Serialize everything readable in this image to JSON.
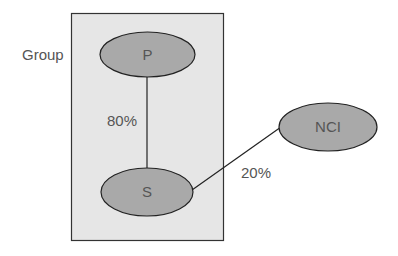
{
  "diagram": {
    "group": {
      "label": "Group",
      "fill": "#e6e6e6",
      "stroke": "#333333"
    },
    "nodes": [
      {
        "id": "P",
        "label": "P",
        "fill": "#a9a9a9"
      },
      {
        "id": "S",
        "label": "S",
        "fill": "#a9a9a9"
      },
      {
        "id": "NCI",
        "label": "NCI",
        "fill": "#a9a9a9"
      }
    ],
    "edges": [
      {
        "from": "P",
        "to": "S",
        "label": "80%"
      },
      {
        "from": "S",
        "to": "NCI",
        "label": "20%"
      }
    ]
  }
}
